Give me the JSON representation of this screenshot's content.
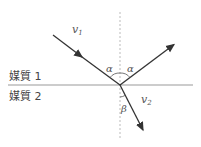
{
  "diagram": {
    "title": "",
    "media": [
      {
        "label": "媒質 1"
      },
      {
        "label": "媒質 2"
      }
    ],
    "rays": [
      {
        "name": "incident",
        "label": "v",
        "subscript": "1"
      },
      {
        "name": "reflected",
        "label": "",
        "subscript": ""
      },
      {
        "name": "refracted",
        "label": "v",
        "subscript": "2"
      }
    ],
    "angles": {
      "incidence": "α",
      "reflection": "α",
      "refraction": "β"
    },
    "colors": {
      "ray": "#333333",
      "interface": "#999999",
      "normal": "#999999"
    }
  }
}
